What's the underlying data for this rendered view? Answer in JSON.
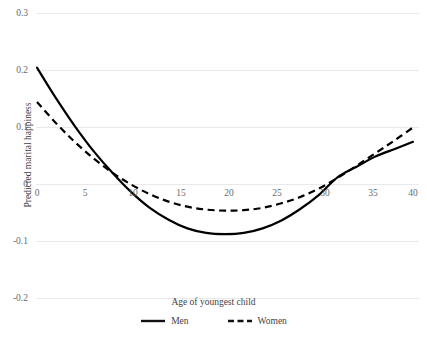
{
  "chart_data": {
    "type": "line",
    "title": "",
    "xlabel": "Age of youngest child",
    "ylabel": "Predicted marital happiness",
    "xlim": [
      0,
      40
    ],
    "ylim": [
      -0.2,
      0.3
    ],
    "grid": true,
    "grid_axis": "y",
    "legend_position": "bottom",
    "xticks": [
      0,
      5,
      10,
      15,
      20,
      25,
      30,
      35,
      40
    ],
    "xtick_labels": [
      "0",
      "5",
      "10",
      "15",
      "20",
      "25",
      "30",
      "35",
      "40"
    ],
    "yticks": [
      0.3,
      0.2,
      0.1,
      0,
      -0.1,
      -0.2
    ],
    "ytick_labels": [
      "0.3",
      "0.2",
      "0.1",
      "0",
      "-0.1",
      "-0.2"
    ],
    "x": [
      0,
      2,
      4,
      6,
      8,
      10,
      12,
      14,
      16,
      18,
      20,
      22,
      24,
      26,
      28,
      30,
      32,
      34,
      36,
      38,
      40
    ],
    "series": [
      {
        "name": "Men",
        "style": "solid",
        "color": "#000000",
        "values": [
          0.205,
          0.152,
          0.103,
          0.059,
          0.021,
          -0.013,
          -0.041,
          -0.062,
          -0.077,
          -0.085,
          -0.087,
          -0.085,
          -0.077,
          -0.063,
          -0.043,
          -0.018,
          0.013,
          0.031,
          0.049,
          0.062,
          0.075
        ]
      },
      {
        "name": "Women",
        "style": "dashed",
        "color": "#000000",
        "values": [
          0.145,
          0.108,
          0.075,
          0.046,
          0.021,
          0.0,
          -0.017,
          -0.03,
          -0.039,
          -0.044,
          -0.046,
          -0.045,
          -0.041,
          -0.033,
          -0.022,
          -0.007,
          0.012,
          0.033,
          0.055,
          0.077,
          0.1
        ]
      }
    ]
  },
  "legend": {
    "entries": [
      {
        "label": "Men",
        "style": "solid"
      },
      {
        "label": "Women",
        "style": "dashed"
      }
    ]
  },
  "axes": {
    "y_title": "Predicted marital happiness",
    "x_title": "Age of youngest child"
  }
}
